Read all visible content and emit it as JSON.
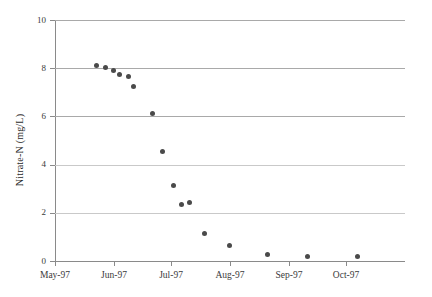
{
  "chart_data": {
    "type": "scatter",
    "title": "",
    "xlabel": "",
    "ylabel": "Nitrate-N (mg/L)",
    "ylim": [
      0,
      10
    ],
    "yticks": [
      0,
      2,
      4,
      6,
      8,
      10
    ],
    "ytick_labels": [
      "0",
      "2",
      "4",
      "6",
      "8",
      "10"
    ],
    "xlim": [
      "May-97",
      "Oct-97"
    ],
    "xticks": [
      "May-97",
      "Jun-97",
      "Jul-97",
      "Aug-97",
      "Sep-97",
      "Oct-97"
    ],
    "xtick_labels": [
      "May-97",
      "Jun-97",
      "Jul-97",
      "Aug-97",
      "Sep-97",
      "Oct-97"
    ],
    "grid": true,
    "grid_axis": "y",
    "legend": false,
    "marker": "filled-circle",
    "marker_color": "#4a4a4a",
    "series": [
      {
        "name": "Nitrate-N",
        "points": [
          {
            "x": 22.0,
            "y": 8.1
          },
          {
            "x": 26.5,
            "y": 8.02
          },
          {
            "x": 30.5,
            "y": 7.92
          },
          {
            "x": 34.0,
            "y": 7.75
          },
          {
            "x": 38.5,
            "y": 7.65
          },
          {
            "x": 41.5,
            "y": 7.25
          },
          {
            "x": 51.0,
            "y": 6.12
          },
          {
            "x": 56.5,
            "y": 4.55
          },
          {
            "x": 62.5,
            "y": 3.15
          },
          {
            "x": 66.5,
            "y": 2.33
          },
          {
            "x": 70.5,
            "y": 2.42
          },
          {
            "x": 78.5,
            "y": 1.15
          },
          {
            "x": 91.5,
            "y": 0.65
          },
          {
            "x": 111.5,
            "y": 0.26
          },
          {
            "x": 133.0,
            "y": 0.18
          },
          {
            "x": 159.0,
            "y": 0.2
          }
        ]
      }
    ],
    "x_axis_units": "days since May-97",
    "x_tick_positions_days": [
      0,
      31,
      61,
      92,
      123,
      153
    ]
  }
}
